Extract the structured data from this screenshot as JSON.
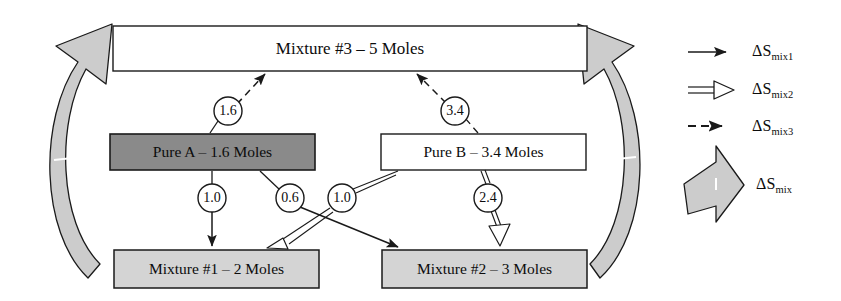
{
  "diagram": {
    "title_text": "",
    "colors": {
      "line": "#1a1a1a",
      "box_white": "#ffffff",
      "box_light_gray": "#d4d4d4",
      "box_dark_gray": "#8a8a8a",
      "block_arrow_gray": "#cccccc",
      "background": "#ffffff"
    },
    "nodes": [
      {
        "id": "mixture3",
        "label": "Mixture #3 – 5 Moles",
        "fill": "white",
        "moles": 5,
        "x": 113,
        "y": 26,
        "w": 474,
        "h": 45
      },
      {
        "id": "pureA",
        "label": "Pure A – 1.6 Moles",
        "fill": "dark-gray",
        "moles": 1.6,
        "x": 110,
        "y": 134,
        "w": 205,
        "h": 36
      },
      {
        "id": "pureB",
        "label": "Pure B – 3.4 Moles",
        "fill": "white",
        "moles": 3.4,
        "x": 381,
        "y": 134,
        "w": 205,
        "h": 36
      },
      {
        "id": "mixture1",
        "label": "Mixture #1 – 2 Moles",
        "fill": "light-gray",
        "moles": 2,
        "x": 114,
        "y": 250,
        "w": 205,
        "h": 38
      },
      {
        "id": "mixture2",
        "label": "Mixture #2 – 3 Moles",
        "fill": "light-gray",
        "moles": 3,
        "x": 382,
        "y": 250,
        "w": 205,
        "h": 38
      }
    ],
    "edges": [
      {
        "id": "e-a-m3",
        "from": "pureA",
        "to": "mixture3",
        "value": "1.6",
        "style": "dashed",
        "series": "dSmix3"
      },
      {
        "id": "e-b-m3",
        "from": "pureB",
        "to": "mixture3",
        "value": "3.4",
        "style": "dashed",
        "series": "dSmix3"
      },
      {
        "id": "e-a-m1",
        "from": "pureA",
        "to": "mixture1",
        "value": "1.0",
        "style": "solid",
        "series": "dSmix1"
      },
      {
        "id": "e-a-m2",
        "from": "pureA",
        "to": "mixture2",
        "value": "0.6",
        "style": "solid",
        "series": "dSmix1"
      },
      {
        "id": "e-b-m1",
        "from": "pureB",
        "to": "mixture1",
        "value": "1.0",
        "style": "double-open",
        "series": "dSmix2"
      },
      {
        "id": "e-b-m2",
        "from": "pureB",
        "to": "mixture2",
        "value": "2.4",
        "style": "double-open",
        "series": "dSmix2"
      }
    ],
    "cycle_arrows": [
      {
        "id": "left-cycle-arrow",
        "from": "mixture1",
        "to": "mixture3",
        "style": "block-gray"
      },
      {
        "id": "right-cycle-arrow",
        "from": "mixture2",
        "to": "mixture3",
        "style": "block-gray"
      }
    ]
  },
  "legend": {
    "items": [
      {
        "id": "dSmix1",
        "symbol": "solid-arrow",
        "base": "ΔS",
        "sub": "mix1"
      },
      {
        "id": "dSmix2",
        "symbol": "double-open-arrow",
        "base": "ΔS",
        "sub": "mix2"
      },
      {
        "id": "dSmix3",
        "symbol": "dashed-arrow",
        "base": "ΔS",
        "sub": "mix3"
      },
      {
        "id": "dSmix",
        "symbol": "block-gray-arrow",
        "base": "ΔS",
        "sub": "mix"
      }
    ]
  }
}
